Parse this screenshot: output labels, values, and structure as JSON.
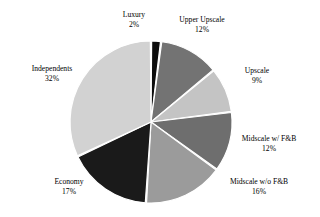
{
  "chart_data": {
    "type": "pie",
    "title": "",
    "subtitle": "",
    "xlabel": "",
    "ylabel": "",
    "legend_position": "none",
    "grid": false,
    "label_format": "name above percent",
    "start_angle_deg": 0,
    "direction": "clockwise",
    "categories": [
      "Luxury",
      "Upper Upscale",
      "Upscale",
      "Midscale w/ F&B",
      "Midscale w/o F&B",
      "Economy",
      "Independents"
    ],
    "values": [
      2,
      12,
      9,
      12,
      16,
      17,
      32
    ],
    "value_labels": [
      "2%",
      "12%",
      "9%",
      "12%",
      "16%",
      "17%",
      "32%"
    ],
    "colors": [
      "#0d0d0d",
      "#737373",
      "#c4c4c4",
      "#6e6e6e",
      "#9b9b9b",
      "#1a1a1a",
      "#d2d2d2"
    ],
    "slice_gap_color": "#ffffff",
    "background_color": "#ffffff",
    "text_color": "#000000",
    "slices": [
      {
        "name": "Luxury",
        "percent": "2%",
        "value": 2,
        "color": "#0d0d0d"
      },
      {
        "name": "Upper Upscale",
        "percent": "12%",
        "value": 12,
        "color": "#737373"
      },
      {
        "name": "Upscale",
        "percent": "9%",
        "value": 9,
        "color": "#c4c4c4"
      },
      {
        "name": "Midscale w/ F&B",
        "percent": "12%",
        "value": 12,
        "color": "#6e6e6e"
      },
      {
        "name": "Midscale w/o F&B",
        "percent": "16%",
        "value": 16,
        "color": "#9b9b9b"
      },
      {
        "name": "Economy",
        "percent": "17%",
        "value": 17,
        "color": "#1a1a1a"
      },
      {
        "name": "Independents",
        "percent": "32%",
        "value": 32,
        "color": "#d2d2d2"
      }
    ],
    "geometry": {
      "center_x": 151,
      "center_y": 122,
      "radius": 81
    }
  }
}
